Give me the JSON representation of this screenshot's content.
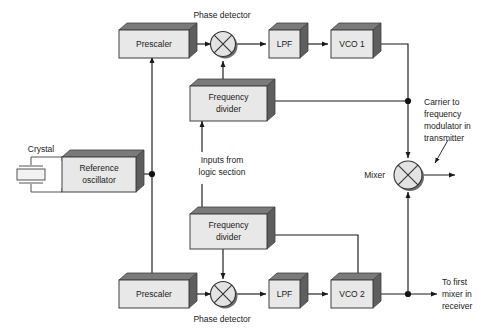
{
  "diagram": {
    "colors": {
      "box_face": "#e8e8e8",
      "box_top": "#7a7a7a",
      "box_side": "#5e5e5e",
      "wire": "#1a1a1a",
      "background": "#ffffff"
    },
    "blocks": [
      {
        "id": "prescaler-top",
        "label": "Prescaler"
      },
      {
        "id": "lpf-top",
        "label": "LPF"
      },
      {
        "id": "vco-1",
        "label": "VCO 1"
      },
      {
        "id": "frequency-divider-top",
        "label_line1": "Frequency",
        "label_line2": "divider"
      },
      {
        "id": "reference-oscillator",
        "label_line1": "Reference",
        "label_line2": "oscillator"
      },
      {
        "id": "frequency-divider-bottom",
        "label_line1": "Frequency",
        "label_line2": "divider"
      },
      {
        "id": "prescaler-bottom",
        "label": "Prescaler"
      },
      {
        "id": "lpf-bottom",
        "label": "LPF"
      },
      {
        "id": "vco-2",
        "label": "VCO 2"
      }
    ],
    "mixers": [
      {
        "id": "phase-detector-top",
        "label": "Phase detector"
      },
      {
        "id": "phase-detector-bottom",
        "label": "Phase detector"
      },
      {
        "id": "mixer",
        "label": "Mixer"
      }
    ],
    "annotations": {
      "crystal": "Crystal",
      "inputs_from_logic_line1": "Inputs from",
      "inputs_from_logic_line2": "logic section",
      "carrier_line1": "Carrier to",
      "carrier_line2": "frequency",
      "carrier_line3": "modulator in",
      "carrier_line4": "transmitter",
      "to_first_mixer_line1": "To first",
      "to_first_mixer_line2": "mixer in",
      "to_first_mixer_line3": "receiver"
    }
  }
}
